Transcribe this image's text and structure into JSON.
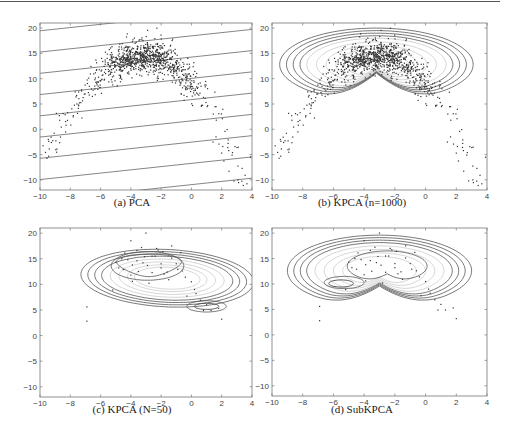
{
  "figure": {
    "panels": [
      {
        "id": "a",
        "caption": "(a)  PCA",
        "kind": "pca"
      },
      {
        "id": "b",
        "caption": "(b)  KPCA (n=1000)",
        "kind": "kpca_full"
      },
      {
        "id": "c",
        "caption": "(c)  KPCA (N=50)",
        "kind": "kpca_small"
      },
      {
        "id": "d",
        "caption": "(d)  SubKPCA",
        "kind": "subkpca"
      }
    ]
  },
  "chart_data": [
    {
      "type": "scatter",
      "title": "(a) PCA",
      "xlabel": "",
      "ylabel": "",
      "xlim": [
        -10,
        4
      ],
      "ylim": [
        -12,
        21
      ],
      "xticks": [
        -10,
        -8,
        -6,
        -4,
        -2,
        0,
        2,
        4
      ],
      "yticks": [
        -10,
        -5,
        0,
        5,
        10,
        15,
        20
      ],
      "grid": false,
      "n_points": 1000,
      "data_description": "Arch/banana-shaped cloud: dense cluster around x=-3, y=14; tails descending to (-8.5,0) on left and (3.5,-5) on right",
      "overlay": "parallel straight contour lines (linear PCA projection), slope ~0.3, spaced ~4 units in y"
    },
    {
      "type": "scatter",
      "title": "(b) KPCA (n=1000)",
      "xlim": [
        -10,
        4
      ],
      "ylim": [
        -12,
        21
      ],
      "xticks": [
        -10,
        -8,
        -6,
        -4,
        -2,
        0,
        2,
        4
      ],
      "yticks": [
        -10,
        -5,
        0,
        5,
        10,
        15,
        20
      ],
      "grid": false,
      "n_points": 1000,
      "overlay": "nested closed kidney-shaped contours centered on x=-3, y=13, outer spanning x -9.3 to 3, y 5.5 to 20"
    },
    {
      "type": "scatter",
      "title": "(c) KPCA (N=50)",
      "xlim": [
        -10,
        4
      ],
      "ylim": [
        -12,
        21
      ],
      "xticks": [
        -10,
        -8,
        -6,
        -4,
        -2,
        0,
        2,
        4
      ],
      "yticks": [
        -10,
        -5,
        0,
        5,
        10,
        15,
        20
      ],
      "grid": false,
      "n_points": 50,
      "overlay": "nested contours elongated diagonally from (-4,14) to (1,5.5), with small closed contour around (1,5.5)"
    },
    {
      "type": "scatter",
      "title": "(d) SubKPCA",
      "xlim": [
        -10,
        4
      ],
      "ylim": [
        -12,
        21
      ],
      "xticks": [
        -10,
        -8,
        -6,
        -4,
        -2,
        0,
        2,
        4
      ],
      "yticks": [
        -10,
        -5,
        0,
        5,
        10,
        15,
        20
      ],
      "grid": false,
      "n_points": 50,
      "overlay": "nested kidney-shaped contours similar to (b), with small closed contour around (-5.5,10)"
    }
  ],
  "sample_points": [
    [
      -3.0,
      20
    ],
    [
      -4.0,
      18.5
    ],
    [
      -2.3,
      17
    ],
    [
      -3.3,
      17.2
    ],
    [
      -1.9,
      16.4
    ],
    [
      -4.6,
      15
    ],
    [
      -4.2,
      14.8
    ],
    [
      -3.1,
      15.4
    ],
    [
      -2.6,
      15.5
    ],
    [
      -2.4,
      15.5
    ],
    [
      -1.3,
      15.1
    ],
    [
      -3.9,
      13.8
    ],
    [
      -3.2,
      14.2
    ],
    [
      -2.0,
      14
    ],
    [
      -1.0,
      14
    ],
    [
      -4.8,
      13.2
    ],
    [
      -4.5,
      12.9
    ],
    [
      -3.5,
      12.5
    ],
    [
      -2.6,
      12.3
    ],
    [
      -1.6,
      12.4
    ],
    [
      -0.9,
      12.9
    ],
    [
      -0.6,
      12.6
    ],
    [
      -1.8,
      12
    ],
    [
      -0.4,
      11.4
    ],
    [
      -3.9,
      10.6
    ],
    [
      -2.8,
      10.2
    ],
    [
      0.0,
      10.5
    ],
    [
      0.2,
      9
    ],
    [
      -5.2,
      8.9
    ],
    [
      -0.3,
      7.7
    ],
    [
      0.6,
      6.9
    ],
    [
      1.0,
      6.0
    ],
    [
      0.8,
      4.9
    ],
    [
      1.3,
      4.9
    ],
    [
      2.0,
      3.2
    ],
    [
      -6.9,
      5.6
    ],
    [
      -6.9,
      2.8
    ],
    [
      -1.3,
      17.5
    ],
    [
      -3.6,
      16.6
    ],
    [
      -2.0,
      13.2
    ],
    [
      -4.0,
      11.8
    ],
    [
      -2.9,
      13.7
    ],
    [
      -1.5,
      10.9
    ],
    [
      0.3,
      8.2
    ],
    [
      -0.7,
      16.2
    ],
    [
      -5.0,
      14.3
    ],
    [
      1.8,
      5.3
    ],
    [
      -3.6,
      14.6
    ],
    [
      -2.2,
      16.7
    ],
    [
      -4.4,
      16.1
    ]
  ]
}
